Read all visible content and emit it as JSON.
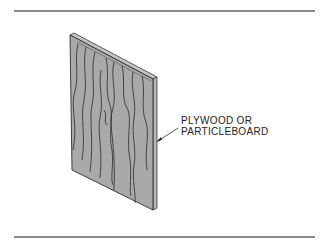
{
  "figure": {
    "label_lines": [
      "PLYWOOD OR",
      "PARTICLEBOARD"
    ],
    "colors": {
      "panel_face": "#a9a9a9",
      "panel_edge": "#c4c4c4",
      "grain": "#2a2a2a",
      "rule": "#8a8a8a"
    }
  }
}
